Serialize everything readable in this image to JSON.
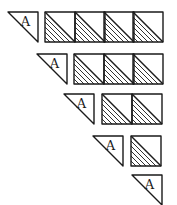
{
  "diagram": {
    "label": "A",
    "colors": {
      "ink": "#1a1a1a",
      "background": "#ffffff"
    },
    "rows": [
      {
        "triangle": {
          "x": 8,
          "y": 12,
          "size": 30
        },
        "squares": [
          {
            "x": 45,
            "y": 12
          },
          {
            "x": 75,
            "y": 12
          },
          {
            "x": 104,
            "y": 12
          },
          {
            "x": 133,
            "y": 12
          }
        ]
      },
      {
        "triangle": {
          "x": 37,
          "y": 54,
          "size": 30
        },
        "squares": [
          {
            "x": 74,
            "y": 54
          },
          {
            "x": 104,
            "y": 54
          },
          {
            "x": 133,
            "y": 54
          }
        ]
      },
      {
        "triangle": {
          "x": 64,
          "y": 94,
          "size": 30
        },
        "squares": [
          {
            "x": 102,
            "y": 94
          },
          {
            "x": 132,
            "y": 94
          }
        ]
      },
      {
        "triangle": {
          "x": 93,
          "y": 136,
          "size": 30
        },
        "squares": [
          {
            "x": 131,
            "y": 136
          }
        ]
      },
      {
        "triangle": {
          "x": 132,
          "y": 175,
          "size": 30
        },
        "squares": []
      }
    ],
    "square_size": 30
  }
}
